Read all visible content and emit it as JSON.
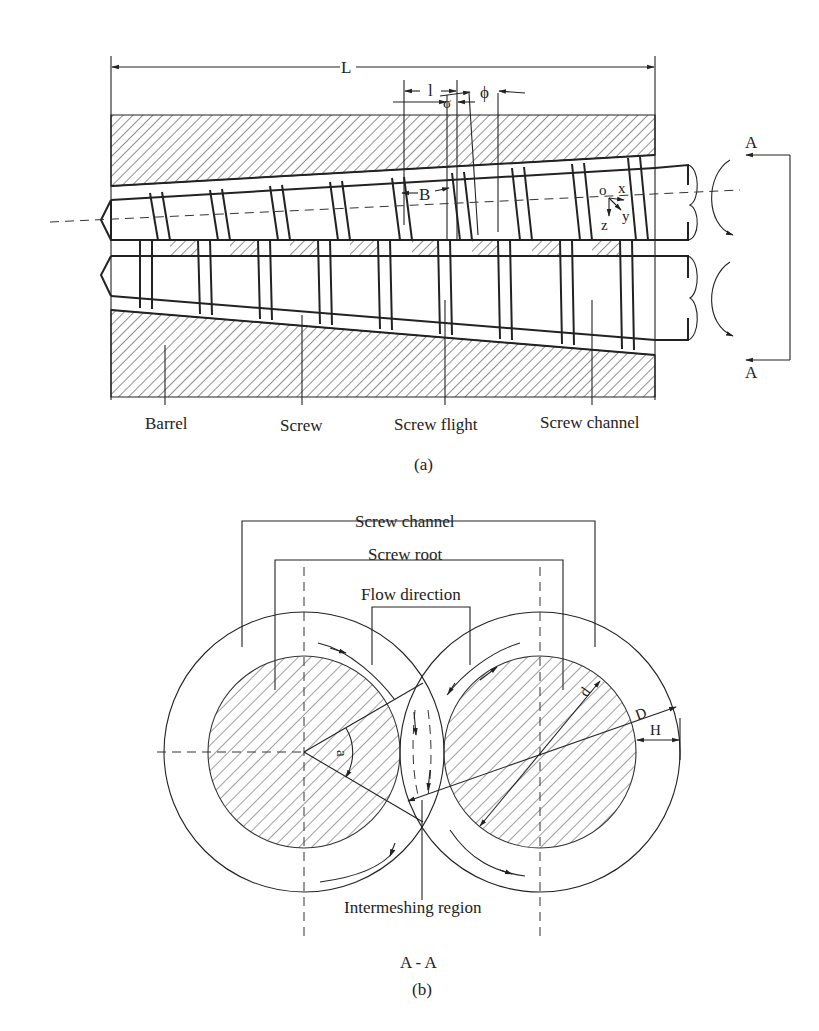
{
  "figure": {
    "panel_a": {
      "caption": "(a)",
      "dimensions": {
        "length": "L",
        "lead": "l",
        "flight_width": "σ",
        "helix_angle": "ϕ",
        "channel_width": "B"
      },
      "axes": {
        "origin": "o",
        "x": "x",
        "y": "y",
        "z": "z"
      },
      "section_marker_top": "A",
      "section_marker_bottom": "A",
      "labels": {
        "barrel": "Barrel",
        "screw": "Screw",
        "screw_flight": "Screw flight",
        "screw_channel": "Screw channel"
      }
    },
    "panel_b": {
      "caption": "(b)",
      "section_title": "A - A",
      "labels": {
        "screw_channel": "Screw channel",
        "screw_root": "Screw root",
        "flow_direction": "Flow direction",
        "intermeshing_region": "Intermeshing region"
      },
      "dimensions": {
        "angle": "a",
        "root_diameter": "d",
        "outer_diameter": "D",
        "channel_depth": "H"
      }
    }
  },
  "colors": {
    "ink": "#222222",
    "background": "#ffffff"
  }
}
